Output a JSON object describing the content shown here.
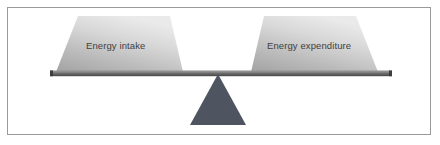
{
  "figure": {
    "background_color": "#ffffff",
    "border_color": "#9a9a9a"
  },
  "diagram": {
    "type": "seesaw-balance",
    "state": "balanced",
    "beam": {
      "name": "balance-beam",
      "color": "#4a4a4a",
      "highlight_color": "#8d8d8d"
    },
    "fulcrum": {
      "name": "fulcrum-triangle",
      "color": "#4e5560"
    },
    "blocks": [
      {
        "id": "energy-intake",
        "label": "Energy intake",
        "side": "left",
        "fill_light": "#e3e3e3",
        "fill_dark": "#9d9d9d"
      },
      {
        "id": "energy-expenditure",
        "label": "Energy expenditure",
        "side": "right",
        "fill_light": "#e3e3e3",
        "fill_dark": "#9d9d9d"
      }
    ],
    "label_color": "#3f3f3f"
  }
}
